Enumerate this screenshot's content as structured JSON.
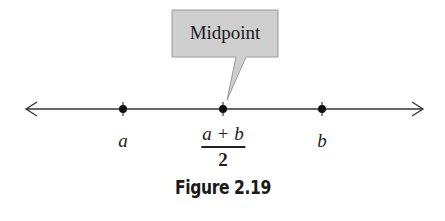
{
  "figure": {
    "caption": "Figure 2.19",
    "callout": {
      "label": "Midpoint",
      "fill_color": "#cfcfcf",
      "border_color": "#9a9a9a"
    },
    "number_line": {
      "direction": "both",
      "color": "#333333",
      "points": [
        {
          "name": "a",
          "label": "a"
        },
        {
          "name": "midpoint",
          "label_numerator": "a + b",
          "label_denominator": "2"
        },
        {
          "name": "b",
          "label": "b"
        }
      ]
    }
  }
}
